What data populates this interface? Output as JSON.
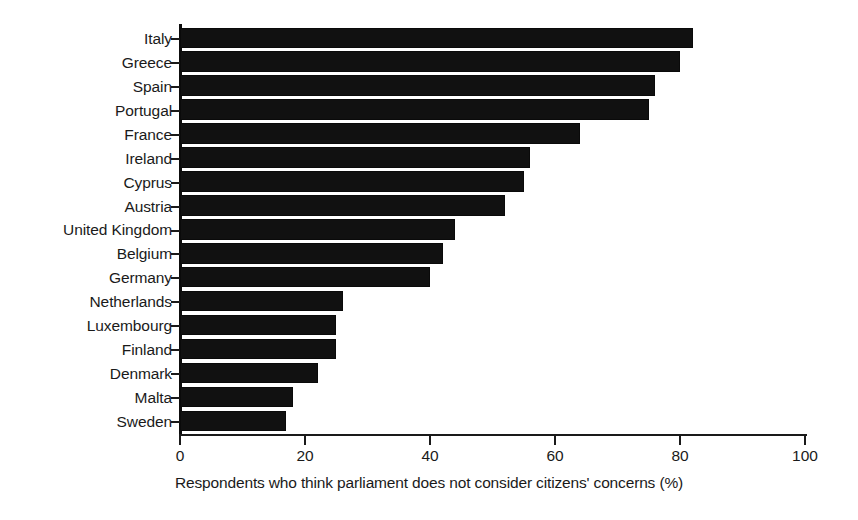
{
  "chart_data": {
    "type": "bar",
    "orientation": "horizontal",
    "title": "",
    "subtitle": "",
    "xlabel": "Respondents who think parliament does not consider citizens' concerns (%)",
    "ylabel": "",
    "xlim": [
      0,
      100
    ],
    "xticks": [
      0,
      20,
      40,
      60,
      80,
      100
    ],
    "xtick_labels": [
      "0",
      "20",
      "40",
      "60",
      "80",
      "100"
    ],
    "grid": false,
    "legend": null,
    "bar_color": "#111111",
    "axis_color": "#1a1a1a",
    "background": "#ffffff",
    "categories": [
      "Italy",
      "Greece",
      "Spain",
      "Portugal",
      "France",
      "Ireland",
      "Cyprus",
      "Austria",
      "United Kingdom",
      "Belgium",
      "Germany",
      "Netherlands",
      "Luxembourg",
      "Finland",
      "Denmark",
      "Malta",
      "Sweden"
    ],
    "values": [
      82,
      80,
      76,
      75,
      64,
      56,
      55,
      52,
      44,
      42,
      40,
      26,
      25,
      25,
      22,
      18,
      17
    ]
  }
}
